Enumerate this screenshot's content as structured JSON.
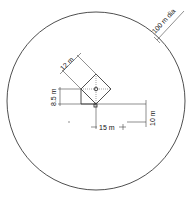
{
  "diagram": {
    "boundary": {
      "shape": "circle",
      "label": "100 m dia"
    },
    "dimensions": [
      {
        "id": "diagonal",
        "label": "12 m"
      },
      {
        "id": "vertical",
        "label": "8.5 m"
      },
      {
        "id": "horizontal",
        "label": "15 m"
      },
      {
        "id": "offset",
        "label": "10 m"
      }
    ],
    "features": [
      {
        "id": "building",
        "shape": "square rotated 45 deg with rectangular annex"
      },
      {
        "id": "center-marker",
        "shape": "small circle"
      },
      {
        "id": "corner-marker",
        "shape": "small square"
      }
    ],
    "colors": {
      "line": "#222222",
      "background": "#ffffff"
    }
  }
}
